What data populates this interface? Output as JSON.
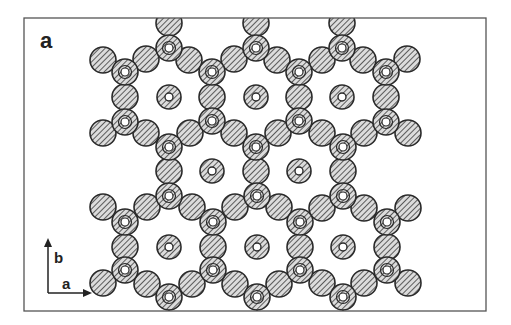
{
  "figure": {
    "panel_label": "a",
    "frame": {
      "x": 24,
      "y": 18,
      "width": 462,
      "height": 293
    },
    "colors": {
      "stroke": "#2a2a2a",
      "hatch": "#3a3a3a",
      "fill": "#d9d9d9",
      "frame": "#555555",
      "background": "#ffffff"
    },
    "axes": {
      "origin": [
        48,
        293
      ],
      "b": {
        "label": "b",
        "end": [
          48,
          238
        ],
        "label_pos": [
          54,
          263
        ]
      },
      "a": {
        "label": "a",
        "end": [
          92,
          293
        ],
        "label_pos": [
          62,
          289
        ]
      }
    },
    "radii": {
      "atom": 13,
      "tri_inner": 4,
      "iso_inner": 4
    },
    "tri_nodes": [
      [
        169,
        48
      ],
      [
        256,
        48
      ],
      [
        342,
        48
      ],
      [
        125,
        72
      ],
      [
        212,
        72
      ],
      [
        299,
        72
      ],
      [
        386,
        72
      ],
      [
        125,
        122
      ],
      [
        212,
        121
      ],
      [
        299,
        121
      ],
      [
        386,
        122
      ],
      [
        169,
        147
      ],
      [
        256,
        147
      ],
      [
        343,
        147
      ],
      [
        169,
        196
      ],
      [
        257,
        196
      ],
      [
        343,
        196
      ],
      [
        125,
        222
      ],
      [
        213,
        222
      ],
      [
        300,
        222
      ],
      [
        387,
        222
      ],
      [
        125,
        270
      ],
      [
        213,
        270
      ],
      [
        300,
        270
      ],
      [
        387,
        270
      ],
      [
        169,
        297
      ],
      [
        257,
        297
      ],
      [
        343,
        297
      ]
    ],
    "bridges": [
      [
        169,
        23
      ],
      [
        256,
        23
      ],
      [
        342,
        23
      ],
      [
        103,
        60
      ],
      [
        146,
        59
      ],
      [
        189,
        60
      ],
      [
        234,
        59
      ],
      [
        277,
        60
      ],
      [
        322,
        60
      ],
      [
        363,
        60
      ],
      [
        407,
        59
      ],
      [
        125,
        97
      ],
      [
        212,
        97
      ],
      [
        299,
        97
      ],
      [
        386,
        97
      ],
      [
        103,
        133
      ],
      [
        146,
        133
      ],
      [
        190,
        133
      ],
      [
        234,
        133
      ],
      [
        278,
        133
      ],
      [
        322,
        133
      ],
      [
        364,
        133
      ],
      [
        408,
        133
      ],
      [
        169,
        171
      ],
      [
        256,
        171
      ],
      [
        343,
        171
      ],
      [
        103,
        207
      ],
      [
        147,
        207
      ],
      [
        192,
        207
      ],
      [
        235,
        207
      ],
      [
        279,
        207
      ],
      [
        322,
        208
      ],
      [
        364,
        208
      ],
      [
        408,
        208
      ],
      [
        125,
        247
      ],
      [
        213,
        247
      ],
      [
        300,
        247
      ],
      [
        387,
        247
      ],
      [
        103,
        283
      ],
      [
        147,
        284
      ],
      [
        192,
        284
      ],
      [
        235,
        284
      ],
      [
        279,
        284
      ],
      [
        322,
        283
      ],
      [
        364,
        283
      ],
      [
        408,
        283
      ]
    ],
    "isolated": [
      [
        169,
        97
      ],
      [
        256,
        97
      ],
      [
        342,
        97
      ],
      [
        212,
        171
      ],
      [
        299,
        171
      ],
      [
        169,
        247
      ],
      [
        257,
        247
      ],
      [
        343,
        247
      ]
    ],
    "edge_bonds": [
      [
        [
          169,
          297
        ],
        [
          169,
          311
        ]
      ],
      [
        [
          257,
          297
        ],
        [
          257,
          311
        ]
      ],
      [
        [
          343,
          297
        ],
        [
          343,
          311
        ]
      ]
    ]
  }
}
